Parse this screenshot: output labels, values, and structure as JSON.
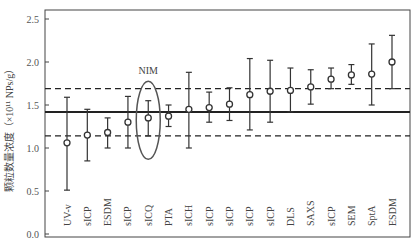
{
  "chart_data": {
    "type": "scatter",
    "subtype": "errorbar",
    "title": "",
    "xlabel": "",
    "ylabel": "颗粒数量浓度（×10¹¹ NPs/g）",
    "ylim": [
      0.0,
      2.5
    ],
    "yticks": [
      0.0,
      0.5,
      1.0,
      1.5,
      2.0,
      2.5
    ],
    "ytick_labels": [
      "0.0",
      "0.5",
      "1.0",
      "1.5",
      "2.0",
      "2.5"
    ],
    "grid": false,
    "legend": null,
    "categories": [
      "UV-v",
      "sICP",
      "ESDM",
      "sICP",
      "sICQ",
      "PTA",
      "sICH",
      "sICP",
      "sICP",
      "sICP",
      "sICP",
      "DLS",
      "SAXS",
      "sICP",
      "SEM",
      "SptA",
      "ESDM"
    ],
    "series": [
      {
        "name": "measurements",
        "marker": "open-circle",
        "values": [
          1.06,
          1.15,
          1.18,
          1.3,
          1.35,
          1.37,
          1.45,
          1.47,
          1.51,
          1.62,
          1.66,
          1.67,
          1.71,
          1.8,
          1.85,
          1.86,
          2.0
        ],
        "lower": [
          0.51,
          0.85,
          1.0,
          1.0,
          1.14,
          1.25,
          1.0,
          1.3,
          1.32,
          1.21,
          1.3,
          1.42,
          1.51,
          1.69,
          1.74,
          1.5,
          1.69
        ],
        "upper": [
          1.59,
          1.45,
          1.35,
          1.6,
          1.55,
          1.5,
          1.88,
          1.65,
          1.7,
          2.04,
          2.02,
          1.93,
          1.91,
          1.93,
          1.97,
          2.21,
          2.31
        ]
      }
    ],
    "reference_lines": [
      {
        "name": "consensus-mean",
        "style": "solid",
        "value": 1.42
      },
      {
        "name": "upper-bound",
        "style": "dashed",
        "value": 1.69
      },
      {
        "name": "lower-bound",
        "style": "dashed",
        "value": 1.14
      }
    ],
    "annotations": [
      {
        "text": "NIM",
        "target_index": 4,
        "shape": "ellipse"
      }
    ]
  },
  "colors": {
    "axis": "#444444",
    "data": "#333333",
    "reference": "#222222",
    "text": "#444444"
  }
}
